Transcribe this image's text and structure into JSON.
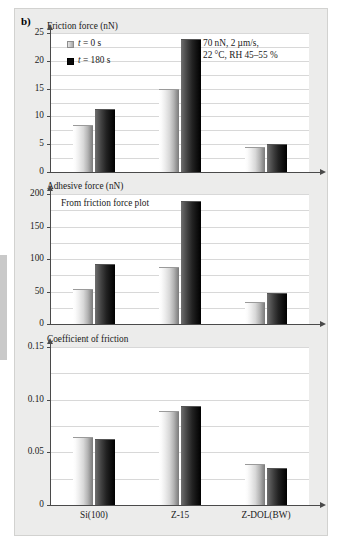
{
  "figure": {
    "panel_label": "b)"
  },
  "legend": {
    "items": [
      {
        "label": "t = 0 s",
        "italic_prefix": "t",
        "rest": " = 0 s",
        "color": "#d8d8d8"
      },
      {
        "label": "t = 180 s",
        "italic_prefix": "t",
        "rest": " = 180 s",
        "color": "#0a0a0a"
      }
    ]
  },
  "annotation": {
    "line1": "70 nN, 2 µm/s,",
    "line2": "22 °C, RH 45–55 %"
  },
  "chart_data": [
    {
      "type": "bar",
      "title": "Friction force (nN)",
      "xlabel": "",
      "ylabel": "Friction force (nN)",
      "categories": [
        "Si(100)",
        "Z-15",
        "Z-DOL(BW)"
      ],
      "series": [
        {
          "name": "t = 0 s",
          "values": [
            8.3,
            14.8,
            4.3
          ],
          "color": "#d8d8d8"
        },
        {
          "name": "t = 180 s",
          "values": [
            11.1,
            23.8,
            4.9
          ],
          "color": "#0a0a0a"
        }
      ],
      "ylim": [
        0,
        25
      ],
      "yticks": [
        "0",
        "5",
        "10",
        "15",
        "20",
        "25"
      ],
      "ytick_values": [
        0,
        5,
        10,
        15,
        20,
        25
      ],
      "grid": true,
      "legend_position": "top-left",
      "annotations": [
        "70 nN, 2 µm/s,",
        "22 °C, RH 45–55 %"
      ],
      "show_xticklabels": false
    },
    {
      "type": "bar",
      "title": "Adhesive force (nN)",
      "xlabel": "",
      "ylabel": "Adhesive force (nN)",
      "categories": [
        "Si(100)",
        "Z-15",
        "Z-DOL(BW)"
      ],
      "series": [
        {
          "name": "t = 0 s",
          "values": [
            52,
            86,
            32
          ],
          "color": "#d8d8d8"
        },
        {
          "name": "t = 180 s",
          "values": [
            91,
            187,
            46
          ],
          "color": "#0a0a0a"
        }
      ],
      "ylim": [
        0,
        200
      ],
      "yticks": [
        "0",
        "50",
        "100",
        "150",
        "200"
      ],
      "ytick_values": [
        0,
        50,
        100,
        150,
        200
      ],
      "grid": true,
      "legend_position": "none",
      "annotations": [
        "From friction force plot"
      ],
      "show_xticklabels": false
    },
    {
      "type": "bar",
      "title": "Coefficient of friction",
      "xlabel": "",
      "ylabel": "Coefficient of friction",
      "categories": [
        "Si(100)",
        "Z-15",
        "Z-DOL(BW)"
      ],
      "series": [
        {
          "name": "t = 0 s",
          "values": [
            0.064,
            0.088,
            0.038
          ],
          "color": "#d8d8d8"
        },
        {
          "name": "t = 180 s",
          "values": [
            0.062,
            0.093,
            0.034
          ],
          "color": "#0a0a0a"
        }
      ],
      "ylim": [
        0,
        0.15
      ],
      "yticks": [
        "0",
        "0.05",
        "0.10",
        "0.15"
      ],
      "ytick_values": [
        0,
        0.05,
        0.1,
        0.15
      ],
      "grid": true,
      "legend_position": "none",
      "annotations": [],
      "show_xticklabels": true
    }
  ]
}
